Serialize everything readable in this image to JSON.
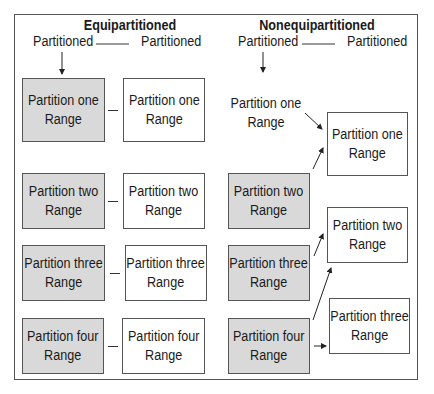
{
  "equipartitioned": {
    "title": "Equipartitioned",
    "left_label": "Partitioned",
    "right_label": "Partitioned",
    "left_column": [
      {
        "line1": "Partition one",
        "line2": "Range"
      },
      {
        "line1": "Partition two",
        "line2": "Range"
      },
      {
        "line1": "Partition three",
        "line2": "Range"
      },
      {
        "line1": "Partition four",
        "line2": "Range"
      }
    ],
    "right_column": [
      {
        "line1": "Partition one",
        "line2": "Range"
      },
      {
        "line1": "Partition two",
        "line2": "Range"
      },
      {
        "line1": "Partition three",
        "line2": "Range"
      },
      {
        "line1": "Partition four",
        "line2": "Range"
      }
    ]
  },
  "nonequipartitioned": {
    "title": "Nonequipartitioned",
    "left_label": "Partitioned",
    "right_label": "Partitioned",
    "left_column": [
      {
        "line1": "Partition one",
        "line2": "Range"
      },
      {
        "line1": "Partition two",
        "line2": "Range"
      },
      {
        "line1": "Partition three",
        "line2": "Range"
      },
      {
        "line1": "Partition four",
        "line2": "Range"
      }
    ],
    "right_column": [
      {
        "line1": "Partition one",
        "line2": "Range"
      },
      {
        "line1": "Partition two",
        "line2": "Range"
      },
      {
        "line1": "Partition three",
        "line2": "Range"
      }
    ]
  },
  "colors": {
    "partitioned_fill": "#d9d9d9",
    "plain_fill": "#ffffff",
    "border": "#555555"
  }
}
